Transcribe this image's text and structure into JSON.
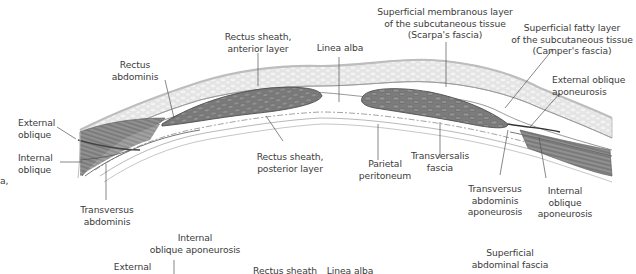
{
  "figure": {
    "colors": {
      "muscle_dark": "#6e6e6e",
      "muscle_mid": "#8c8c8c",
      "fat_layer": "#d6d6d6",
      "fascia_line": "#9a9a9a",
      "leader_line": "#555555",
      "text": "#3c3c3c",
      "background": "#ffffff"
    }
  },
  "labels": {
    "rectus_abdominis": [
      "Rectus",
      "abdominis"
    ],
    "rectus_sheath_anterior": [
      "Rectus sheath,",
      "anterior layer"
    ],
    "linea_alba_top": [
      "Linea alba"
    ],
    "scarpa": [
      "Superficial membranous layer",
      "of the subcutaneous tissue",
      "(Scarpa's fascia)"
    ],
    "camper": [
      "Superficial fatty layer",
      "of the subcutaneous tissue",
      "(Camper's fascia)"
    ],
    "external_oblique_aponeurosis": [
      "External oblique",
      "aponeurosis"
    ],
    "external_oblique": [
      "External",
      "oblique"
    ],
    "internal_oblique": [
      "Internal",
      "oblique"
    ],
    "rectus_sheath_posterior": [
      "Rectus sheath,",
      "posterior layer"
    ],
    "parietal_peritoneum": [
      "Parietal",
      "peritoneum"
    ],
    "transversalis_fascia": [
      "Transversalis",
      "fascia"
    ],
    "transversus_abdominis_aponeurosis": [
      "Transversus",
      "abdominis",
      "aponeurosis"
    ],
    "internal_oblique_aponeurosis_right": [
      "Internal",
      "oblique",
      "aponeurosis"
    ],
    "transversus_abdominis": [
      "Transversus",
      "abdominis"
    ],
    "fragment_left": "a,",
    "internal_oblique_aponeurosis_bottom": [
      "Internal",
      "oblique aponeurosis"
    ],
    "external_bottom": [
      "External"
    ],
    "rectus_sheath_bottom": [
      "Rectus sheath"
    ],
    "linea_alba_bottom": [
      "Linea alba"
    ],
    "superficial_abdominal_fascia": [
      "Superficial",
      "abdominal fascia"
    ]
  }
}
